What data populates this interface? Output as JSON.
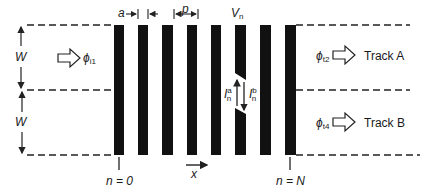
{
  "diagram": {
    "labels": {
      "a": "a",
      "p": "p",
      "v_n": "V",
      "v_n_sub": "n",
      "w_top": "W",
      "w_bottom": "W",
      "phi_in": "ϕ",
      "phi_in_sub": "i1",
      "phi_out_a": "ϕ",
      "phi_out_a_sub": "t2",
      "phi_out_b": "ϕ",
      "phi_out_b_sub": "t4",
      "track_a": "Track A",
      "track_b": "Track B",
      "i_a": "I",
      "i_a_sup": "a",
      "i_a_sub": "n",
      "i_b": "I",
      "i_b_sup": "b",
      "i_b_sub": "n",
      "x_axis": "x",
      "n_start": "n = 0",
      "n_end": "n = N"
    },
    "bars_count": 8,
    "colors": {
      "bar": "#111111",
      "line": "#222222",
      "background": "#ffffff"
    }
  }
}
